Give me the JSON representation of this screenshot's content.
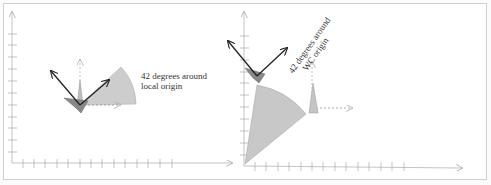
{
  "figure": {
    "left_panel": {
      "caption_line1": "42 degrees around",
      "caption_line2": "local origin",
      "rotation_degrees": 42,
      "pivot": "local origin"
    },
    "right_panel": {
      "caption_line1": "42 degrees around",
      "caption_line2": "WC origin",
      "rotation_degrees": 42,
      "pivot": "WC origin"
    },
    "colors": {
      "frame": "#cfcfcf",
      "axis": "#999999",
      "wedge_fill": "#c8c8c8",
      "wedge_stroke": "#a8a8a8",
      "triangle_dark": "#7a7a7a",
      "arrow": "#222222"
    }
  }
}
